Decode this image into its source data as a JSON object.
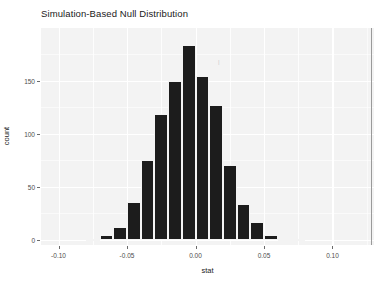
{
  "chart_data": {
    "type": "bar",
    "title": "Simulation-Based Null Distribution",
    "xlabel": "stat",
    "ylabel": "count",
    "grid": true,
    "legend": null,
    "xlim": [
      -0.1128,
      0.1303
    ],
    "ylim": [
      0,
      193
    ],
    "binwidth": 0.01,
    "xticks": [
      -0.1,
      -0.05,
      0.0,
      0.05,
      0.1
    ],
    "xtick_labels": [
      "-0.10",
      "-0.05",
      "0.00",
      "0.05",
      "0.10"
    ],
    "yticks": [
      0,
      50,
      100,
      150
    ],
    "ytick_labels": [
      "0",
      "50",
      "100",
      "150"
    ],
    "bin_centers": [
      -0.075,
      -0.065,
      -0.055,
      -0.045,
      -0.035,
      -0.025,
      -0.015,
      -0.005,
      0.005,
      0.015,
      0.025,
      0.035,
      0.045,
      0.055,
      0.065,
      0.075
    ],
    "categories": [
      "-0.075",
      "-0.065",
      "-0.055",
      "-0.045",
      "-0.035",
      "-0.025",
      "-0.015",
      "-0.005",
      "0.005",
      "0.015",
      "0.025",
      "0.035",
      "0.045",
      "0.055",
      "0.065",
      "0.075"
    ],
    "values": [
      1,
      5,
      12,
      36,
      75,
      119,
      150,
      184,
      154,
      127,
      71,
      34,
      17,
      5,
      1,
      1
    ],
    "annotations": [
      {
        "name": "observed-statistic-line",
        "type": "vline",
        "x": 0.128,
        "color": "#9a9a9a"
      }
    ],
    "colors": {
      "bar_fill": "#1c1c1c",
      "panel_background": "#f3f3f3",
      "gridline": "#ffffff",
      "vline": "#9a9a9a",
      "text": "#1a1a1a",
      "tick_text": "#4d4d4d"
    }
  },
  "axes": {
    "x_title": "stat",
    "y_title": "count"
  },
  "artifact": {
    "mark": "|"
  }
}
